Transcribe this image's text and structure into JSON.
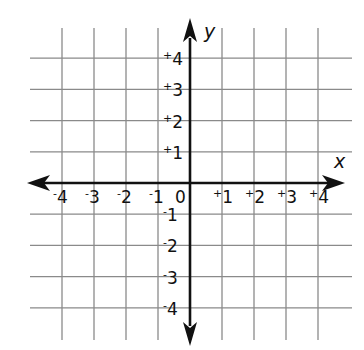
{
  "diagram": {
    "type": "coordinate-plane",
    "x_axis_label": "x",
    "y_axis_label": "y",
    "x_range": [
      -4,
      4
    ],
    "y_range": [
      -4,
      4
    ],
    "grid_extent": [
      -5,
      5
    ],
    "origin_label": "0",
    "x_ticks": [
      {
        "value": -4,
        "sign": "-",
        "digit": "4"
      },
      {
        "value": -3,
        "sign": "-",
        "digit": "3"
      },
      {
        "value": -2,
        "sign": "-",
        "digit": "2"
      },
      {
        "value": -1,
        "sign": "-",
        "digit": "1"
      },
      {
        "value": 1,
        "sign": "+",
        "digit": "1"
      },
      {
        "value": 2,
        "sign": "+",
        "digit": "2"
      },
      {
        "value": 3,
        "sign": "+",
        "digit": "3"
      },
      {
        "value": 4,
        "sign": "+",
        "digit": "4"
      }
    ],
    "y_ticks": [
      {
        "value": 4,
        "sign": "+",
        "digit": "4"
      },
      {
        "value": 3,
        "sign": "+",
        "digit": "3"
      },
      {
        "value": 2,
        "sign": "+",
        "digit": "2"
      },
      {
        "value": 1,
        "sign": "+",
        "digit": "1"
      },
      {
        "value": -1,
        "sign": "-",
        "digit": "1"
      },
      {
        "value": -2,
        "sign": "-",
        "digit": "2"
      },
      {
        "value": -3,
        "sign": "-",
        "digit": "3"
      },
      {
        "value": -4,
        "sign": "-",
        "digit": "4"
      }
    ],
    "colors": {
      "grid": "#8a8a8a",
      "axis": "#111111",
      "text": "#111111"
    }
  }
}
